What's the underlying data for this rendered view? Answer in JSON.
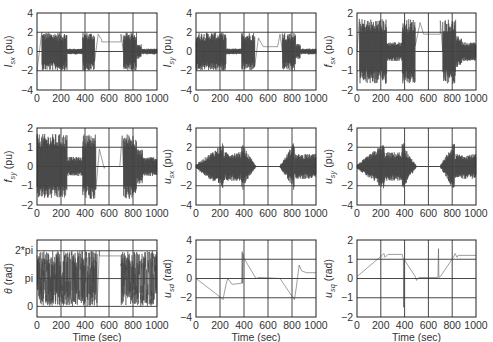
{
  "figure": {
    "xlabel": "Time (sec)",
    "xticks": [
      0,
      200,
      400,
      600,
      800,
      1000
    ],
    "xlim": [
      0,
      1000
    ]
  },
  "chart_data": [
    {
      "id": "Isx",
      "type": "line",
      "ylabel_main": "I",
      "ylabel_sub": "sx",
      "ylabel_unit": " (pu)",
      "ylim": [
        -4,
        4
      ],
      "yticks": [
        -4,
        -2,
        0,
        2,
        4
      ],
      "ytick_labels": [
        "−4",
        "−2",
        "0",
        "2",
        "4"
      ],
      "xlabel": "",
      "grid": true,
      "description": "Saturated oscillation between -2 and 2 during 40-250 s, 380-480 s, 720-830 s; small oscillation ~±0.3 around 0 during 250-380 s and 830-1000 s; transient then ~1 between 500-700 s",
      "segments": [
        {
          "t": [
            0,
            40
          ],
          "kind": "ramp",
          "from": -2,
          "to": 2
        },
        {
          "t": [
            40,
            250
          ],
          "kind": "osc",
          "center": 0,
          "amp": 2
        },
        {
          "t": [
            250,
            380
          ],
          "kind": "osc",
          "center": 0,
          "amp": 0.3
        },
        {
          "t": [
            380,
            480
          ],
          "kind": "osc",
          "center": 0,
          "amp": 2
        },
        {
          "t": [
            480,
            540
          ],
          "kind": "transient",
          "points": [
            [
              480,
              -1
            ],
            [
              510,
              1.8
            ],
            [
              540,
              1.2
            ]
          ]
        },
        {
          "t": [
            540,
            700
          ],
          "kind": "flat",
          "value": 1.0
        },
        {
          "t": [
            700,
            720
          ],
          "kind": "transient",
          "points": [
            [
              700,
              1.8
            ],
            [
              720,
              0
            ]
          ]
        },
        {
          "t": [
            720,
            830
          ],
          "kind": "osc",
          "center": 0,
          "amp": 2
        },
        {
          "t": [
            830,
            870
          ],
          "kind": "osc",
          "center": 0,
          "amp": 0.8
        },
        {
          "t": [
            870,
            1000
          ],
          "kind": "osc",
          "center": 0,
          "amp": 0.3
        }
      ]
    },
    {
      "id": "Isy",
      "type": "line",
      "ylabel_main": "I",
      "ylabel_sub": "sy",
      "ylabel_unit": " (pu)",
      "ylim": [
        -4,
        4
      ],
      "yticks": [
        -4,
        -2,
        0,
        2,
        4
      ],
      "ytick_labels": [
        "−4",
        "−2",
        "0",
        "2",
        "4"
      ],
      "xlabel": "",
      "grid": true,
      "description": "Saturated oscillation between -2 and 2 during 0-250 s, 380-480 s, 720-830 s; small oscillation ~±0.3 elsewhere; flat ~0.5 between 560-680 s",
      "segments": [
        {
          "t": [
            0,
            250
          ],
          "kind": "osc",
          "center": 0,
          "amp": 2
        },
        {
          "t": [
            250,
            380
          ],
          "kind": "osc",
          "center": 0,
          "amp": 0.3
        },
        {
          "t": [
            380,
            490
          ],
          "kind": "osc",
          "center": 0,
          "amp": 2
        },
        {
          "t": [
            490,
            560
          ],
          "kind": "transient",
          "points": [
            [
              490,
              -1.5
            ],
            [
              520,
              1.4
            ],
            [
              560,
              0.5
            ]
          ]
        },
        {
          "t": [
            560,
            680
          ],
          "kind": "flat",
          "value": 0.5
        },
        {
          "t": [
            680,
            720
          ],
          "kind": "transient",
          "points": [
            [
              680,
              0.5
            ],
            [
              700,
              1.8
            ],
            [
              720,
              0
            ]
          ]
        },
        {
          "t": [
            720,
            830
          ],
          "kind": "osc",
          "center": 0,
          "amp": 2
        },
        {
          "t": [
            830,
            870
          ],
          "kind": "osc",
          "center": 0,
          "amp": 0.8
        },
        {
          "t": [
            870,
            1000
          ],
          "kind": "osc",
          "center": 0,
          "amp": 0.3
        }
      ]
    },
    {
      "id": "fsx",
      "type": "line",
      "ylabel_main": "f",
      "ylabel_sub": "sx",
      "ylabel_unit": " (pu)",
      "ylim": [
        -2,
        2
      ],
      "yticks": [
        -2,
        -1,
        0,
        1,
        2
      ],
      "ytick_labels": [
        "−2",
        "−1",
        "0",
        "1",
        "2"
      ],
      "xlabel": "",
      "grid": true,
      "description": "Oscillation between -1.7 and 1.7 during 20-250 s, 380-490 s, 720-830 s; ~±0.5 oscillation 250-380 s and 830-1000 s; flat ~0.9 between 560-700 s",
      "segments": [
        {
          "t": [
            0,
            20
          ],
          "kind": "ramp",
          "from": 0,
          "to": 1.7
        },
        {
          "t": [
            20,
            250
          ],
          "kind": "osc",
          "center": 0,
          "amp": 1.7
        },
        {
          "t": [
            250,
            380
          ],
          "kind": "osc",
          "center": 0,
          "amp": 0.5
        },
        {
          "t": [
            380,
            490
          ],
          "kind": "osc",
          "center": 0,
          "amp": 1.7
        },
        {
          "t": [
            490,
            560
          ],
          "kind": "transient",
          "points": [
            [
              490,
              0.3
            ],
            [
              530,
              1.5
            ],
            [
              560,
              0.9
            ]
          ]
        },
        {
          "t": [
            560,
            700
          ],
          "kind": "flat",
          "value": 0.9
        },
        {
          "t": [
            700,
            720
          ],
          "kind": "transient",
          "points": [
            [
              700,
              1.6
            ],
            [
              720,
              0
            ]
          ]
        },
        {
          "t": [
            720,
            830
          ],
          "kind": "osc",
          "center": 0,
          "amp": 1.7
        },
        {
          "t": [
            830,
            880
          ],
          "kind": "osc",
          "center": 0,
          "amp": 0.8
        },
        {
          "t": [
            880,
            1000
          ],
          "kind": "osc",
          "center": 0,
          "amp": 0.5
        }
      ]
    },
    {
      "id": "fsy",
      "type": "line",
      "ylabel_main": "f",
      "ylabel_sub": "sy",
      "ylabel_unit": " (pu)",
      "ylim": [
        -2,
        2
      ],
      "yticks": [
        -2,
        -1,
        0,
        1,
        2
      ],
      "ytick_labels": [
        "−2",
        "−1",
        "0",
        "1",
        "2"
      ],
      "xlabel": "",
      "grid": true,
      "description": "Oscillation between -1.7 and 1.7 during 0-250 s, 380-490 s, 720-830 s; ~±0.5 oscillation 250-380 s and 830-1000 s; flat ~0 between 560-700 s",
      "segments": [
        {
          "t": [
            0,
            250
          ],
          "kind": "osc",
          "center": 0,
          "amp": 1.7
        },
        {
          "t": [
            250,
            380
          ],
          "kind": "osc",
          "center": 0,
          "amp": 0.5
        },
        {
          "t": [
            380,
            490
          ],
          "kind": "osc",
          "center": 0,
          "amp": 1.7
        },
        {
          "t": [
            490,
            570
          ],
          "kind": "transient",
          "points": [
            [
              490,
              -1.2
            ],
            [
              520,
              0.9
            ],
            [
              560,
              -0.1
            ],
            [
              570,
              0
            ]
          ]
        },
        {
          "t": [
            570,
            690
          ],
          "kind": "flat",
          "value": 0.0
        },
        {
          "t": [
            690,
            720
          ],
          "kind": "transient",
          "points": [
            [
              690,
              0
            ],
            [
              710,
              1.6
            ],
            [
              720,
              0
            ]
          ]
        },
        {
          "t": [
            720,
            830
          ],
          "kind": "osc",
          "center": 0,
          "amp": 1.7
        },
        {
          "t": [
            830,
            880
          ],
          "kind": "osc",
          "center": 0,
          "amp": 0.9
        },
        {
          "t": [
            880,
            1000
          ],
          "kind": "osc",
          "center": 0,
          "amp": 0.5
        }
      ]
    },
    {
      "id": "usx",
      "type": "line",
      "ylabel_main": "u",
      "ylabel_sub": "sx",
      "ylabel_unit": " (pu)",
      "ylim": [
        -4,
        4
      ],
      "yticks": [
        -4,
        -2,
        0,
        2,
        4
      ],
      "ytick_labels": [
        "−4",
        "−2",
        "0",
        "2",
        "4"
      ],
      "xlabel": "",
      "grid": true,
      "description": "Growing oscillation 0-230 s peaking ~±2.5; ~±1.5 during 240-380 s; peak ~±2.5 near 400 s decaying to 0 by 500 s; ~0 between 500-700 s; growing 700-820 s peak ~±2.5 then ~±1.3 until 1000 s",
      "segments": [
        {
          "t": [
            0,
            230
          ],
          "kind": "osc_env",
          "amp_from": 0.2,
          "amp_to": 2.5
        },
        {
          "t": [
            230,
            380
          ],
          "kind": "osc",
          "center": 0,
          "amp": 1.5
        },
        {
          "t": [
            380,
            400
          ],
          "kind": "osc",
          "center": 0,
          "amp": 2.5
        },
        {
          "t": [
            400,
            500
          ],
          "kind": "osc_env",
          "amp_from": 2.0,
          "amp_to": 0.05
        },
        {
          "t": [
            500,
            700
          ],
          "kind": "flat",
          "value": 0.0
        },
        {
          "t": [
            700,
            820
          ],
          "kind": "osc_env",
          "amp_from": 0.1,
          "amp_to": 2.6
        },
        {
          "t": [
            820,
            1000
          ],
          "kind": "osc",
          "center": 0,
          "amp": 1.3
        }
      ]
    },
    {
      "id": "usy",
      "type": "line",
      "ylabel_main": "u",
      "ylabel_sub": "sy",
      "ylabel_unit": " (pu)",
      "ylim": [
        -4,
        4
      ],
      "yticks": [
        -4,
        -2,
        0,
        2,
        4
      ],
      "ytick_labels": [
        "−4",
        "−2",
        "0",
        "2",
        "4"
      ],
      "xlabel": "",
      "grid": true,
      "description": "Similar to u_sx: growing oscillation 0-230 s peaking ~±2.5, ~±1.5 during 240-380 s, decay to 0 by 500 s, ~0 until 700 s, growth to ~±2.5 at 820 s then ~±1.3",
      "segments": [
        {
          "t": [
            0,
            230
          ],
          "kind": "osc_env",
          "amp_from": 0.2,
          "amp_to": 2.5
        },
        {
          "t": [
            230,
            380
          ],
          "kind": "osc",
          "center": 0,
          "amp": 1.5
        },
        {
          "t": [
            380,
            400
          ],
          "kind": "osc",
          "center": 0,
          "amp": 2.5
        },
        {
          "t": [
            400,
            500
          ],
          "kind": "osc_env",
          "amp_from": 2.0,
          "amp_to": 0.05
        },
        {
          "t": [
            500,
            700
          ],
          "kind": "flat",
          "value": 0.0
        },
        {
          "t": [
            700,
            820
          ],
          "kind": "osc_env",
          "amp_from": 0.1,
          "amp_to": 2.6
        },
        {
          "t": [
            820,
            1000
          ],
          "kind": "osc",
          "center": 0,
          "amp": 1.3
        }
      ]
    },
    {
      "id": "theta",
      "type": "line",
      "ylabel_main": "θ",
      "ylabel_sub": "",
      "ylabel_unit": " (rad)",
      "ylim": [
        -1.2,
        7.5
      ],
      "yticks": [
        0,
        3.1416,
        6.2832
      ],
      "ytick_labels": [
        "0",
        "pi",
        "2*pi"
      ],
      "xlabel": "Time (sec)",
      "grid": true,
      "description": "Wrapped angle sawtooth between 0 and 2*pi during 0-500 s and 700-1000 s; flat ~5.6 (just below 2*pi) between 520-700 s",
      "segments": [
        {
          "t": [
            0,
            500
          ],
          "kind": "wrap",
          "lo": 0,
          "hi": 6.2832
        },
        {
          "t": [
            500,
            520
          ],
          "kind": "transient",
          "points": [
            [
              500,
              0
            ],
            [
              520,
              6.28
            ]
          ]
        },
        {
          "t": [
            520,
            700
          ],
          "kind": "flat",
          "value": 5.7
        },
        {
          "t": [
            700,
            1000
          ],
          "kind": "wrap",
          "lo": 0,
          "hi": 6.2832
        }
      ]
    },
    {
      "id": "usd",
      "type": "line",
      "ylabel_main": "u",
      "ylabel_sub": "sd",
      "ylabel_unit": " (rad)",
      "ylim": [
        -4,
        4
      ],
      "yticks": [
        -4,
        -2,
        0,
        2,
        4
      ],
      "ytick_labels": [
        "−4",
        "−2",
        "0",
        "2",
        "4"
      ],
      "xlabel": "Time (sec)",
      "grid": true,
      "x": [
        0,
        210,
        225,
        250,
        265,
        300,
        380,
        385,
        388,
        392,
        395,
        500,
        520,
        540,
        700,
        820,
        835,
        860,
        880,
        920,
        1000
      ],
      "y": [
        0,
        -2.0,
        -2.2,
        -0.6,
        0.0,
        -0.6,
        -0.5,
        2.8,
        -0.5,
        2.6,
        2.2,
        0.0,
        0.1,
        0.1,
        0.0,
        -2.2,
        -1.0,
        1.4,
        0.8,
        0.6,
        0.6
      ]
    },
    {
      "id": "usq",
      "type": "line",
      "ylabel_main": "u",
      "ylabel_sub": "sq",
      "ylabel_unit": " (rad)",
      "ylim": [
        -2,
        2
      ],
      "yticks": [
        -2,
        -1,
        0,
        1,
        2
      ],
      "ytick_labels": [
        "−2",
        "−1",
        "0",
        "1",
        "2"
      ],
      "xlabel": "Time (sec)",
      "grid": true,
      "x": [
        0,
        210,
        225,
        235,
        260,
        380,
        390,
        392,
        395,
        490,
        500,
        520,
        590,
        680,
        685,
        688,
        700,
        810,
        825,
        840,
        850,
        1000
      ],
      "y": [
        0.1,
        1.2,
        1.3,
        1.1,
        1.25,
        1.25,
        1.0,
        -1.5,
        1.0,
        0.1,
        -0.1,
        0.05,
        0.05,
        0.05,
        1.55,
        0.05,
        0.1,
        1.1,
        1.3,
        1.1,
        1.2,
        1.2
      ]
    }
  ]
}
